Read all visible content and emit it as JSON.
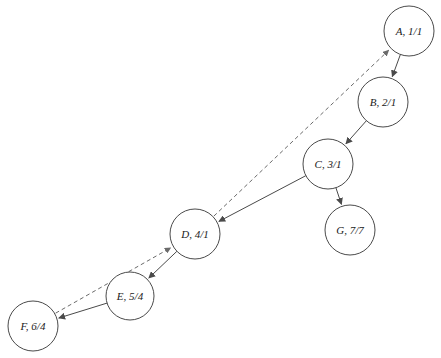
{
  "diagram": {
    "nodes": [
      {
        "id": "A",
        "label": "A, 1/1",
        "cx": 409,
        "cy": 31,
        "r": 25
      },
      {
        "id": "B",
        "label": "B, 2/1",
        "cx": 383,
        "cy": 102,
        "r": 25
      },
      {
        "id": "C",
        "label": "C, 3/1",
        "cx": 328,
        "cy": 164,
        "r": 25
      },
      {
        "id": "D",
        "label": "D, 4/1",
        "cx": 195,
        "cy": 234,
        "r": 25
      },
      {
        "id": "E",
        "label": "E, 5/4",
        "cx": 130,
        "cy": 296,
        "r": 24
      },
      {
        "id": "F",
        "label": "F, 6/4",
        "cx": 33,
        "cy": 326,
        "r": 25
      },
      {
        "id": "G",
        "label": "G, 7/7",
        "cx": 350,
        "cy": 230,
        "r": 25
      }
    ],
    "solid_edges": [
      {
        "from": "A",
        "to": "B"
      },
      {
        "from": "B",
        "to": "C"
      },
      {
        "from": "C",
        "to": "D"
      },
      {
        "from": "C",
        "to": "G"
      },
      {
        "from": "D",
        "to": "E"
      },
      {
        "from": "E",
        "to": "F"
      }
    ],
    "dashed_edges": [
      {
        "from": "F",
        "to": "D"
      },
      {
        "from": "D",
        "to": "A"
      }
    ],
    "caption": ""
  }
}
